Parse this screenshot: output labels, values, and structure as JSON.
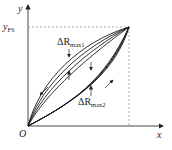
{
  "diagram": {
    "type": "hysteresis-loop",
    "axes": {
      "x_label": "x",
      "y_label": "y",
      "origin_label": "O",
      "y_fs_label": {
        "main": "y",
        "sub": "FS"
      }
    },
    "annotations": {
      "delta_r_max1": {
        "prefix": "ΔR",
        "sub": "max1"
      },
      "delta_r_max2": {
        "prefix": "ΔR",
        "sub": "max2"
      }
    },
    "colors": {
      "curve": "#1a1a1a",
      "axis": "#333333",
      "dashed": "#888888"
    },
    "curve_count_per_branch": 4
  }
}
